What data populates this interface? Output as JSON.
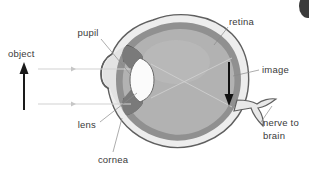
{
  "figure": {
    "background_color": "#ffffff"
  },
  "labels": {
    "object": "object",
    "pupil": "pupil",
    "retina": "retina",
    "image": "image",
    "lens": "lens",
    "cornea": "cornea",
    "nerve_line1": "nerve to",
    "nerve_line2": "brain"
  },
  "colors": {
    "sclera": "#e8e8e8",
    "retina_band": "#8f8f8f",
    "vitreous": "#b0b0b0",
    "iris": "#7d7d7d",
    "lens_fill": "#fbfbfb",
    "outline": "#5a5a5a",
    "label_text": "#3a3a3a",
    "leader_line": "#8a8a8a",
    "ray": "#d2d2d2",
    "object_arrow": "#1a1a1a",
    "image_arrow": "#111111",
    "corner_blob": "#3b3b3b"
  },
  "elements": {
    "object_arrow_direction": "up",
    "image_arrow_direction": "down",
    "ray_count": 2
  }
}
